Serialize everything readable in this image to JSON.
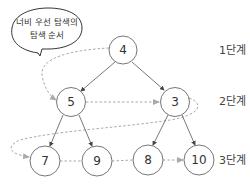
{
  "callout": {
    "line1": "너비 우선 탐색의",
    "line2": "탐색 순서"
  },
  "levels": [
    {
      "label": "1단계"
    },
    {
      "label": "2단계"
    },
    {
      "label": "3단계"
    }
  ],
  "nodes": [
    {
      "id": "n4",
      "value": "4",
      "level": 1
    },
    {
      "id": "n5",
      "value": "5",
      "level": 2
    },
    {
      "id": "n3",
      "value": "3",
      "level": 2
    },
    {
      "id": "n7",
      "value": "7",
      "level": 3
    },
    {
      "id": "n9",
      "value": "9",
      "level": 3
    },
    {
      "id": "n8",
      "value": "8",
      "level": 3
    },
    {
      "id": "n10",
      "value": "10",
      "level": 3
    }
  ],
  "edges": [
    {
      "from": "4",
      "to": "5"
    },
    {
      "from": "4",
      "to": "3"
    },
    {
      "from": "5",
      "to": "7"
    },
    {
      "from": "5",
      "to": "9"
    },
    {
      "from": "3",
      "to": "8"
    },
    {
      "from": "3",
      "to": "10"
    }
  ],
  "traversal_order": [
    "4",
    "5",
    "3",
    "7",
    "9",
    "8",
    "10"
  ],
  "colors": {
    "node_stroke": "#666666",
    "edge": "#555555",
    "traversal_path": "#aaaaaa"
  }
}
